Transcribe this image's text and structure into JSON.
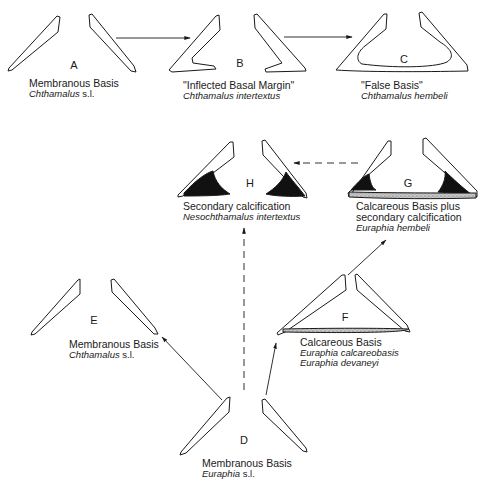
{
  "diagram": {
    "kind": "evolutionary pathways of barnacle basis types",
    "nodes": [
      {
        "id": "A",
        "letter": "A",
        "title": "Membranous Basis",
        "species": [
          {
            "genus": "Chthamalus",
            "suffix": " s.l."
          }
        ]
      },
      {
        "id": "B",
        "letter": "B",
        "title": "\"Inflected Basal Margin\"",
        "species": [
          {
            "genus": "Chthamalus intertextus",
            "suffix": ""
          }
        ]
      },
      {
        "id": "C",
        "letter": "C",
        "title": "\"False Basis\"",
        "species": [
          {
            "genus": "Chthamalus hembeli",
            "suffix": ""
          }
        ]
      },
      {
        "id": "H",
        "letter": "H",
        "title": "Secondary calcification",
        "species": [
          {
            "genus": "Nesochthamalus intertextus",
            "suffix": ""
          }
        ]
      },
      {
        "id": "G",
        "letter": "G",
        "title": "Calcareous Basis plus",
        "title2": "secondary calcification",
        "species": [
          {
            "genus": "Euraphia hembeli",
            "suffix": ""
          }
        ]
      },
      {
        "id": "E",
        "letter": "E",
        "title": "Membranous Basis",
        "species": [
          {
            "genus": "Chthamalus",
            "suffix": " s.l."
          }
        ]
      },
      {
        "id": "F",
        "letter": "F",
        "title": "Calcareous Basis",
        "species": [
          {
            "genus": "Euraphia calcareobasis",
            "suffix": ""
          },
          {
            "genus": "Euraphia devaneyi",
            "suffix": ""
          }
        ]
      },
      {
        "id": "D",
        "letter": "D",
        "title": "Membranous Basis",
        "species": [
          {
            "genus": "Euraphia",
            "suffix": " s.l."
          }
        ]
      }
    ],
    "edges": [
      {
        "from": "A",
        "to": "B",
        "style": "solid"
      },
      {
        "from": "B",
        "to": "C",
        "style": "solid"
      },
      {
        "from": "G",
        "to": "H",
        "style": "dashed"
      },
      {
        "from": "D",
        "to": "H",
        "style": "dashed"
      },
      {
        "from": "D",
        "to": "E",
        "style": "solid"
      },
      {
        "from": "D",
        "to": "F",
        "style": "solid"
      },
      {
        "from": "F",
        "to": "G",
        "style": "solid"
      }
    ],
    "colors": {
      "line": "#1a1a1a",
      "fill": "#111111",
      "stipple": "#9a9a9a",
      "background": "#ffffff"
    }
  }
}
